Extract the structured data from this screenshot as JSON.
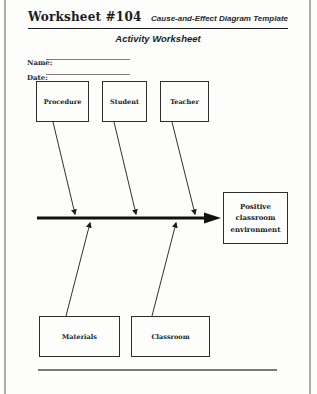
{
  "header": {
    "worksheet_number": "Worksheet #104",
    "template_title": "Cause-and-Effect Diagram Template"
  },
  "title": "Activity Worksheet",
  "fields": {
    "name_label": "Name:",
    "date_label": "Date:"
  },
  "diagram": {
    "type": "fishbone-cause-effect",
    "effect": "Positive classroom environment",
    "top_causes": [
      "Procedure",
      "Student",
      "Teacher"
    ],
    "bottom_causes": [
      "Materials",
      "Classroom"
    ],
    "ink_color": "#1a1a1a"
  }
}
